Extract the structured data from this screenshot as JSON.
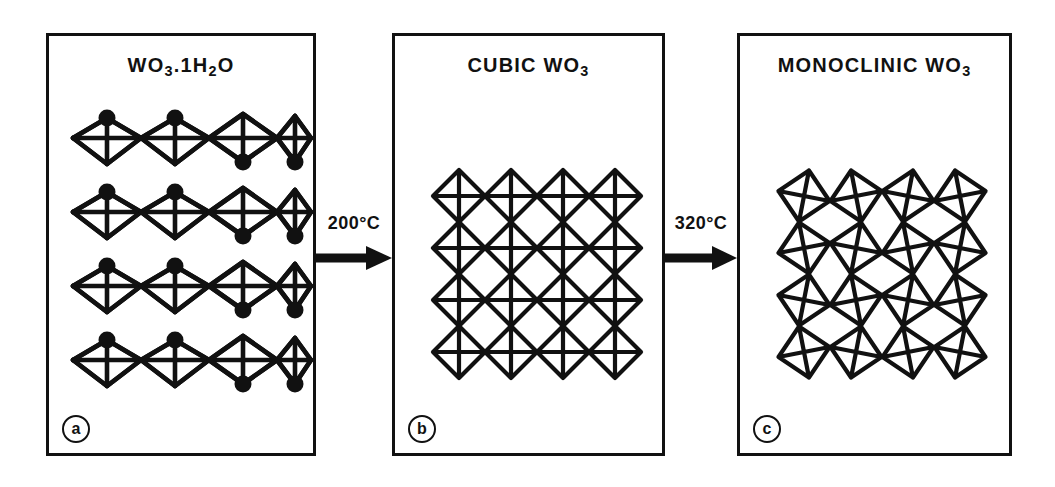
{
  "figure": {
    "caption_absent": true,
    "background_color": "#ffffff",
    "ink_color": "#111111"
  },
  "panels": [
    {
      "tag": "a",
      "title_main": "WO",
      "title_sub1": "3",
      "title_mid": ".1H",
      "title_sub2": "2",
      "title_end": "O",
      "title_plain": "WO3.1H2O",
      "structure": "layered-chains-of-corner-sharing-octahedra-with-water-apex",
      "rows": 4,
      "columns": 4,
      "has_water_dots": true,
      "dot_pattern": "up-up-down-down"
    },
    {
      "tag": "b",
      "title_main": "CUBIC  WO",
      "title_sub1": "3",
      "title_mid": "",
      "title_sub2": "",
      "title_end": "",
      "title_plain": "CUBIC WO3",
      "structure": "regular-grid-of-corner-sharing-octahedra",
      "rows": 4,
      "columns": 4,
      "has_water_dots": false,
      "tilt_degrees": 0
    },
    {
      "tag": "c",
      "title_main": "MONOCLINIC  WO",
      "title_sub1": "3",
      "title_mid": "",
      "title_sub2": "",
      "title_end": "",
      "title_plain": "MONOCLINIC WO3",
      "structure": "tilted-distorted-grid-of-corner-sharing-octahedra",
      "rows": 4,
      "columns": 4,
      "has_water_dots": false,
      "tilt_degrees": 11
    }
  ],
  "arrows": [
    {
      "label": "200°C",
      "from": "a",
      "to": "b"
    },
    {
      "label": "320°C",
      "from": "b",
      "to": "c"
    }
  ]
}
